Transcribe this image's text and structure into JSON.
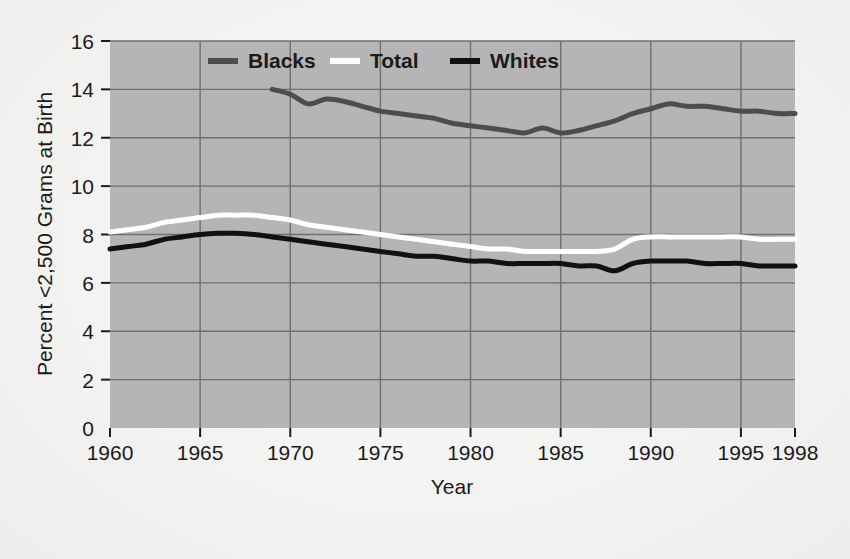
{
  "figure": {
    "background_color": "#f2f2f0",
    "plot_background_color": "#b5b5b5",
    "grid_color": "#6f6f6f",
    "text_color": "#1b1b1b"
  },
  "chart_data": {
    "type": "line",
    "title": "",
    "xlabel": "Year",
    "ylabel": "Percent <2,500 Grams at Birth",
    "xlim": [
      1960,
      1998
    ],
    "ylim": [
      0,
      16
    ],
    "xticks": [
      1960,
      1965,
      1970,
      1975,
      1980,
      1985,
      1990,
      1995,
      1998
    ],
    "xtick_labels": [
      "1960",
      "1965",
      "1970",
      "1975",
      "1980",
      "1985",
      "1990",
      "1995",
      "1998"
    ],
    "yticks": [
      0,
      2,
      4,
      6,
      8,
      10,
      12,
      14,
      16
    ],
    "ytick_labels": [
      "0",
      "2",
      "4",
      "6",
      "8",
      "10",
      "12",
      "14",
      "16"
    ],
    "grid": true,
    "legend_position": "top-center-inside",
    "series": [
      {
        "name": "Blacks",
        "color": "#4d4d4d",
        "line_width": 5,
        "x": [
          1969,
          1970,
          1971,
          1972,
          1973,
          1974,
          1975,
          1976,
          1977,
          1978,
          1979,
          1980,
          1981,
          1982,
          1983,
          1984,
          1985,
          1986,
          1987,
          1988,
          1989,
          1990,
          1991,
          1992,
          1993,
          1994,
          1995,
          1996,
          1997,
          1998
        ],
        "values": [
          14.0,
          13.8,
          13.4,
          13.6,
          13.5,
          13.3,
          13.1,
          13.0,
          12.9,
          12.8,
          12.6,
          12.5,
          12.4,
          12.3,
          12.2,
          12.4,
          12.2,
          12.3,
          12.5,
          12.7,
          13.0,
          13.2,
          13.4,
          13.3,
          13.3,
          13.2,
          13.1,
          13.1,
          13.0,
          13.0
        ],
        "y_start_note": "series begins at 1969"
      },
      {
        "name": "Total",
        "color": "#ffffff",
        "line_width": 5,
        "x": [
          1960,
          1961,
          1962,
          1963,
          1964,
          1965,
          1966,
          1967,
          1968,
          1969,
          1970,
          1971,
          1972,
          1973,
          1974,
          1975,
          1976,
          1977,
          1978,
          1979,
          1980,
          1981,
          1982,
          1983,
          1984,
          1985,
          1986,
          1987,
          1988,
          1989,
          1990,
          1991,
          1992,
          1993,
          1994,
          1995,
          1996,
          1997,
          1998
        ],
        "values": [
          8.1,
          8.2,
          8.3,
          8.5,
          8.6,
          8.7,
          8.8,
          8.8,
          8.8,
          8.7,
          8.6,
          8.4,
          8.3,
          8.2,
          8.1,
          8.0,
          7.9,
          7.8,
          7.7,
          7.6,
          7.5,
          7.4,
          7.4,
          7.3,
          7.3,
          7.3,
          7.3,
          7.3,
          7.4,
          7.8,
          7.9,
          7.9,
          7.9,
          7.9,
          7.9,
          7.9,
          7.8,
          7.8,
          7.8
        ]
      },
      {
        "name": "Whites",
        "color": "#111111",
        "line_width": 5,
        "x": [
          1960,
          1961,
          1962,
          1963,
          1964,
          1965,
          1966,
          1967,
          1968,
          1969,
          1970,
          1971,
          1972,
          1973,
          1974,
          1975,
          1976,
          1977,
          1978,
          1979,
          1980,
          1981,
          1982,
          1983,
          1984,
          1985,
          1986,
          1987,
          1988,
          1989,
          1990,
          1991,
          1992,
          1993,
          1994,
          1995,
          1996,
          1997,
          1998
        ],
        "values": [
          7.4,
          7.5,
          7.6,
          7.8,
          7.9,
          8.0,
          8.05,
          8.05,
          8.0,
          7.9,
          7.8,
          7.7,
          7.6,
          7.5,
          7.4,
          7.3,
          7.2,
          7.1,
          7.1,
          7.0,
          6.9,
          6.9,
          6.8,
          6.8,
          6.8,
          6.8,
          6.7,
          6.7,
          6.5,
          6.8,
          6.9,
          6.9,
          6.9,
          6.8,
          6.8,
          6.8,
          6.7,
          6.7,
          6.7
        ]
      }
    ],
    "legend": [
      {
        "label": "Blacks",
        "color": "#4d4d4d"
      },
      {
        "label": "Total",
        "color": "#ffffff"
      },
      {
        "label": "Whites",
        "color": "#111111"
      }
    ]
  }
}
